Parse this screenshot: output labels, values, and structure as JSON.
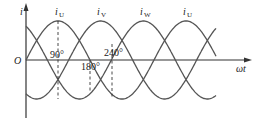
{
  "diagram": {
    "type": "three-phase-current-waveforms",
    "axes": {
      "y_label": "i",
      "x_label": "ωt",
      "origin_label": "O"
    },
    "curves": [
      {
        "name": "iU",
        "label_main": "i",
        "label_sub": "U",
        "phase_deg": 0
      },
      {
        "name": "iV",
        "label_main": "i",
        "label_sub": "V",
        "phase_deg": -120
      },
      {
        "name": "iW",
        "label_main": "i",
        "label_sub": "W",
        "phase_deg": 120
      }
    ],
    "peak_labels": [
      {
        "main": "i",
        "sub": "U"
      },
      {
        "main": "i",
        "sub": "V"
      },
      {
        "main": "i",
        "sub": "W"
      },
      {
        "main": "i",
        "sub": "U"
      }
    ],
    "angle_markers": [
      "90°",
      "180°",
      "240°"
    ],
    "colors": {
      "line": "#555555",
      "axis": "#333333",
      "background": "#ffffff"
    }
  }
}
